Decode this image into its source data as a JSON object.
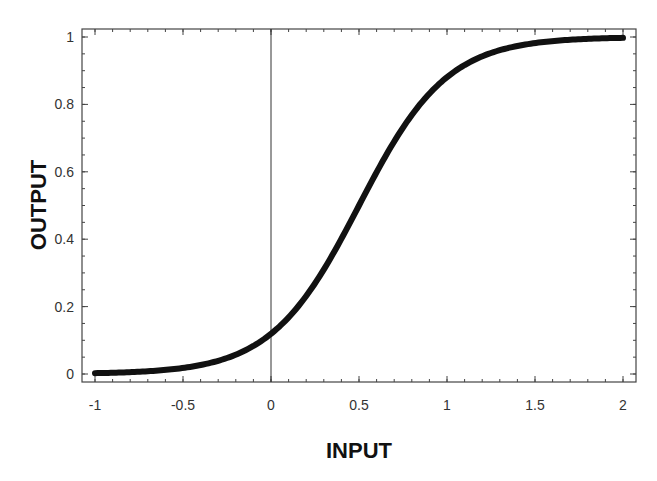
{
  "chart_data": {
    "type": "line",
    "title": "",
    "xlabel": "INPUT",
    "ylabel": "OUTPUT",
    "xlim": [
      -1,
      2
    ],
    "ylim": [
      0,
      1
    ],
    "grid": false,
    "legend": null,
    "x_ticks": [
      -1,
      -0.5,
      0,
      0.5,
      1,
      1.5,
      2
    ],
    "x_tick_labels": [
      "-1",
      "-0.5",
      "0",
      "0.5",
      "1",
      "1.5",
      "2"
    ],
    "y_ticks": [
      0,
      0.2,
      0.4,
      0.6,
      0.8,
      1
    ],
    "y_tick_labels": [
      "0",
      "0.2",
      "0.4",
      "0.6",
      "0.8",
      "1"
    ],
    "annotations": [
      {
        "type": "vertical-line",
        "x": 0
      }
    ],
    "series": [
      {
        "name": "sigmoid",
        "function": "1/(1+exp(-4*(x-0.5)))",
        "x": [
          -1,
          -0.75,
          -0.5,
          -0.25,
          0,
          0.25,
          0.5,
          0.75,
          1,
          1.25,
          1.5,
          1.75,
          2
        ],
        "y": [
          0.002,
          0.007,
          0.018,
          0.047,
          0.119,
          0.269,
          0.5,
          0.731,
          0.881,
          0.953,
          0.982,
          0.993,
          0.998
        ]
      }
    ]
  },
  "colors": {
    "curve": "#111111",
    "axis": "#444444",
    "background": "#ffffff"
  }
}
